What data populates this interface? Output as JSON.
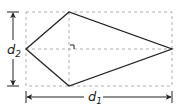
{
  "diagram": {
    "type": "kite-diagonals",
    "labels": {
      "d1": {
        "base": "d",
        "sub": "1"
      },
      "d2": {
        "base": "d",
        "sub": "2"
      }
    },
    "colors": {
      "stroke": "#222222",
      "dash": "#9a9a9a",
      "background": "#ffffff"
    },
    "bounding_rect": {
      "x1": 26,
      "y1": 12,
      "x2": 172,
      "y2": 86
    },
    "vertices": {
      "left": [
        26,
        49
      ],
      "top": [
        69,
        12
      ],
      "right": [
        172,
        49
      ],
      "bottom": [
        69,
        86
      ]
    },
    "right_angle_marker": true
  }
}
